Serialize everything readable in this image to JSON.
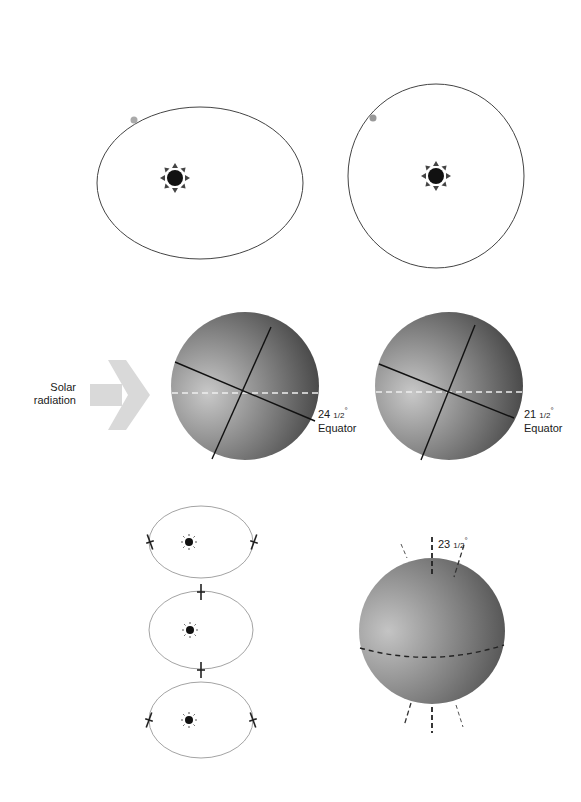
{
  "figure": {
    "topic": "Milankovitch orbital cycles",
    "eccentricity": {
      "panels": [
        {
          "name": "elliptical-orbit",
          "shape": "ellipse"
        },
        {
          "name": "circular-orbit",
          "shape": "circle"
        }
      ],
      "sun_icon": "sun-icon",
      "planet_icon": "planet-dot-icon"
    },
    "obliquity": {
      "arrow_label_line1": "Solar",
      "arrow_label_line2": "radiation",
      "arrow_icon": "arrow-right-icon",
      "globes": [
        {
          "angle_whole": "24",
          "angle_frac": "1/2",
          "degree": "°",
          "label": "Equator"
        },
        {
          "angle_whole": "21",
          "angle_frac": "1/2",
          "degree": "°",
          "label": "Equator"
        }
      ]
    },
    "precession": {
      "orbits": 3,
      "globe": {
        "angle_whole": "23",
        "angle_frac": "1/2",
        "degree": "°"
      }
    },
    "colors": {
      "line": "#333333",
      "orbit_light": "#bbbbbb",
      "arrow": "#d9d9d9",
      "globe_light": "#b8b8b8",
      "globe_dark": "#4a4a4a",
      "planet": "#aaaaaa",
      "dash": "#f0f0f0"
    }
  }
}
